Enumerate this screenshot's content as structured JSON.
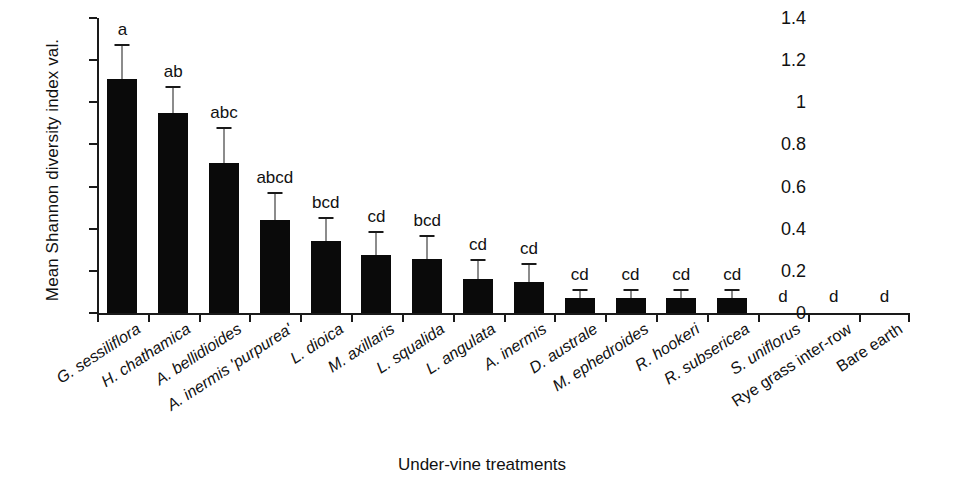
{
  "chart_data": {
    "type": "bar",
    "title": "",
    "xlabel": "Under-vine treatments",
    "ylabel": "Mean Shannon diversity index val.",
    "ylim": [
      0,
      1.4
    ],
    "yticks": [
      0,
      0.2,
      0.4,
      0.6,
      0.8,
      1,
      1.2,
      1.4
    ],
    "ytick_labels": [
      "0",
      "0.2",
      "0.4",
      "0.6",
      "0.8",
      "1",
      "1.2",
      "1.4"
    ],
    "grid": false,
    "legend": "none",
    "bar_color": "#0a0a0a",
    "categories": [
      "G. sessiliflora",
      "H. chathamica",
      "A. bellidioides",
      "A. inermis 'purpurea'",
      "L. dioica",
      "M. axillaris",
      "L. squalida",
      "L. angulata",
      "A. inermis",
      "D. australe",
      "M. ephedroides",
      "R. hookeri",
      "R. subsericea",
      "S. uniflorus",
      "Rye grass inter-row",
      "Bare earth"
    ],
    "category_styles": [
      "italic",
      "italic",
      "italic",
      "italic",
      "italic",
      "italic",
      "italic",
      "italic",
      "italic",
      "italic",
      "italic",
      "italic",
      "italic",
      "italic",
      "upright",
      "upright"
    ],
    "values": [
      1.11,
      0.95,
      0.71,
      0.44,
      0.34,
      0.275,
      0.255,
      0.16,
      0.145,
      0.07,
      0.07,
      0.07,
      0.07,
      0,
      0,
      0
    ],
    "errors": [
      0.155,
      0.12,
      0.165,
      0.125,
      0.105,
      0.105,
      0.105,
      0.085,
      0.085,
      0.035,
      0.035,
      0.035,
      0.035,
      0,
      0,
      0
    ],
    "annotations": [
      "a",
      "ab",
      "abc",
      "abcd",
      "bcd",
      "cd",
      "bcd",
      "cd",
      "cd",
      "cd",
      "cd",
      "cd",
      "cd",
      "d",
      "d",
      "d"
    ]
  }
}
